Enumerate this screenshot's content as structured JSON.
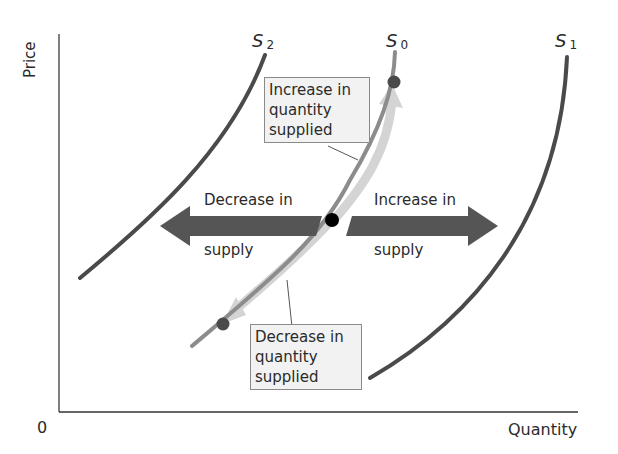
{
  "axes": {
    "y_label": "Price",
    "x_label": "Quantity",
    "origin": "0"
  },
  "curves": {
    "s0": {
      "letter": "S",
      "sub": "0",
      "color": "#8c8c8c"
    },
    "s1": {
      "letter": "S",
      "sub": "1",
      "color": "#4a4a4a"
    },
    "s2": {
      "letter": "S",
      "sub": "2",
      "color": "#4a4a4a"
    }
  },
  "boxes": {
    "increase_qs": [
      "Increase in",
      "quantity",
      "supplied"
    ],
    "decrease_qs": [
      "Decrease in",
      "quantity",
      "supplied"
    ]
  },
  "arrows": {
    "decrease_supply": {
      "line1": "Decrease in",
      "line2": "supply"
    },
    "increase_supply": {
      "line1": "Increase in",
      "line2": "supply"
    }
  },
  "colors": {
    "shift_arrow": "#555555",
    "movement_arrow": "#d0d0d0",
    "point_black": "#000000",
    "point_gray": "#4a4a4a",
    "box_bg": "#f2f2f2"
  }
}
